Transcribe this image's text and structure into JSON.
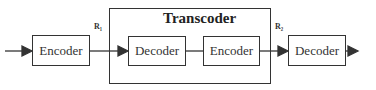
{
  "diagram": {
    "transcoder_title": "Transcoder",
    "blocks": [
      {
        "label": "Encoder"
      },
      {
        "label": "Decoder"
      },
      {
        "label": "Encoder"
      },
      {
        "label": "Decoder"
      }
    ],
    "rates": [
      "R₁",
      "R₂"
    ],
    "colors": {
      "stroke": "#333333",
      "background": "#ffffff"
    }
  }
}
